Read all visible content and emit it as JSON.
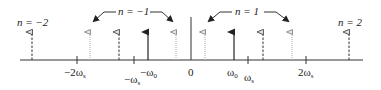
{
  "diagram": {
    "colors": {
      "axis": "#333333",
      "solid_arrow": "#222222",
      "dashed_arrow": "#444444",
      "dotted_arrow": "#aaaaaa",
      "annotation": "#333333"
    },
    "group_labels": {
      "n_minus_2": "n = −2",
      "n_minus_1": "n = −1",
      "n_plus_1": "n = 1",
      "n_plus_2": "n = 2"
    },
    "axis_labels": {
      "minus_2ws": "−2ω",
      "minus_2ws_sub": "s",
      "minus_ws": "−ω",
      "minus_ws_sub": "s",
      "minus_w0": "−ω",
      "minus_w0_sub": "0",
      "zero": "0",
      "w0": "ω",
      "w0_sub": "0",
      "ws": "ω",
      "ws_sub": "s",
      "plus_2ws": "2ω",
      "plus_2ws_sub": "s"
    },
    "impulses": [
      {
        "x": 32,
        "style": "dashed",
        "group": "n=-2"
      },
      {
        "x": 90,
        "style": "dotted",
        "group": "n=-1"
      },
      {
        "x": 119,
        "style": "dashed",
        "group": "n=-1"
      },
      {
        "x": 148,
        "style": "solid",
        "group": "baseband -ω0"
      },
      {
        "x": 176,
        "style": "dotted",
        "group": "n=-1"
      },
      {
        "x": 205,
        "style": "dotted",
        "group": "n=1"
      },
      {
        "x": 234,
        "style": "solid",
        "group": "baseband ω0"
      },
      {
        "x": 263,
        "style": "dashed",
        "group": "n=1"
      },
      {
        "x": 292,
        "style": "dotted",
        "group": "n=1"
      },
      {
        "x": 349,
        "style": "dashed",
        "group": "n=2"
      }
    ]
  }
}
